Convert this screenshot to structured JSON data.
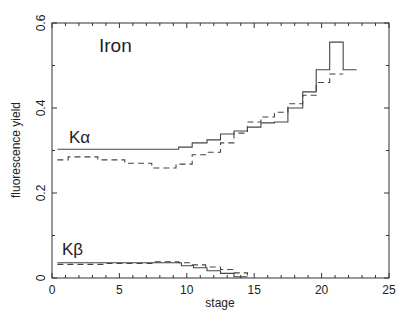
{
  "chart_data": {
    "type": "line",
    "title": "Iron",
    "xlabel": "stage",
    "ylabel": "fluorescence yield",
    "xlim": [
      0,
      25
    ],
    "ylim": [
      0,
      0.6
    ],
    "xticks": [
      0,
      5,
      10,
      15,
      20,
      25
    ],
    "yticks": [
      0,
      0.2,
      0.4,
      0.6
    ],
    "ytick_labels": [
      "0",
      "0.2",
      "0.4",
      "0.6"
    ],
    "grid": false,
    "legend": null,
    "annotations": [
      {
        "text": "Iron",
        "x": 3.5,
        "y": 0.53
      },
      {
        "text": "Kα",
        "x": 1.3,
        "y": 0.31
      },
      {
        "text": "Kβ",
        "x": 1.3,
        "y": 0.045
      }
    ],
    "step_style": "histogram",
    "series": [
      {
        "name": "Kα (solid)",
        "style": "solid",
        "edges": [
          0.4,
          9.4,
          10.4,
          11.5,
          12.5,
          13.5,
          14.5,
          15.5,
          16.5,
          17.5,
          18.6,
          19.6,
          20.6,
          21.6,
          22.6
        ],
        "values": [
          0.303,
          0.308,
          0.318,
          0.325,
          0.339,
          0.346,
          0.355,
          0.365,
          0.367,
          0.4,
          0.438,
          0.49,
          0.555,
          0.49
        ]
      },
      {
        "name": "Kα (dashed)",
        "style": "dashed",
        "edges": [
          0.4,
          1.2,
          3.4,
          5.4,
          7.4,
          9.2,
          10.4,
          11.4,
          12.5,
          13.5,
          14.5,
          15.5,
          16.5,
          17.5,
          18.6,
          19.6,
          20.6,
          21.6
        ],
        "values": [
          0.278,
          0.285,
          0.278,
          0.27,
          0.259,
          0.268,
          0.29,
          0.296,
          0.318,
          0.341,
          0.367,
          0.379,
          0.39,
          0.41,
          0.43,
          0.46,
          0.48
        ]
      },
      {
        "name": "Kβ (solid)",
        "style": "solid",
        "edges": [
          0.4,
          9.6,
          10.5,
          11.5,
          12.5,
          13.5,
          14.5
        ],
        "values": [
          0.036,
          0.029,
          0.024,
          0.017,
          0.011,
          0.003
        ]
      },
      {
        "name": "Kβ (dashed)",
        "style": "dashed",
        "edges": [
          0.4,
          4.0,
          7.5,
          9.4,
          10.4,
          11.4,
          12.5,
          13.5,
          14.5
        ],
        "values": [
          0.032,
          0.034,
          0.038,
          0.036,
          0.031,
          0.026,
          0.02,
          0.012,
          0.004
        ]
      }
    ]
  }
}
